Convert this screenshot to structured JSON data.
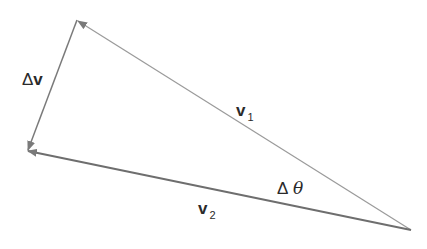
{
  "diagram": {
    "colors": {
      "line": "#8c8c8c",
      "line_dark": "#707070",
      "text": "#2a2a2a",
      "background": "#ffffff"
    },
    "points": {
      "tail": {
        "x": 411,
        "y": 230
      },
      "v1_tip": {
        "x": 77,
        "y": 20
      },
      "v2_tip": {
        "x": 27,
        "y": 151
      }
    },
    "vectors": [
      {
        "id": "v1",
        "from": "tail",
        "to": "v1_tip"
      },
      {
        "id": "v2",
        "from": "tail",
        "to": "v2_tip"
      },
      {
        "id": "delta_v",
        "from": "v1_tip",
        "to": "v2_tip"
      }
    ],
    "labels": {
      "delta_v": {
        "symbol": "Δ",
        "var": "v"
      },
      "v1": {
        "var": "v",
        "sub": "1"
      },
      "v2": {
        "var": "v",
        "sub": "2"
      },
      "delta_theta": {
        "symbol": "Δ",
        "var": "θ"
      }
    }
  }
}
